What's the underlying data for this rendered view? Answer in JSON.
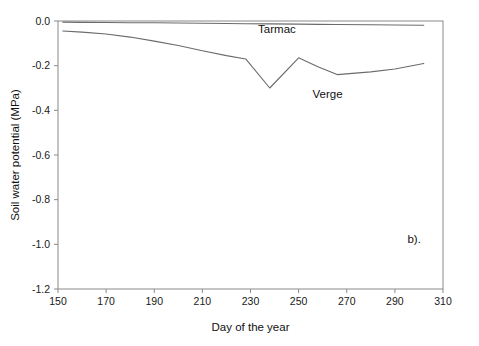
{
  "chart_data": {
    "type": "line",
    "title": "",
    "xlabel": "Day of the year",
    "ylabel": "Soil water potential (MPa)",
    "xlim": [
      150,
      310
    ],
    "ylim": [
      -1.2,
      0.0
    ],
    "xticks": [
      150,
      170,
      190,
      210,
      230,
      250,
      270,
      290,
      310
    ],
    "yticks": [
      0.0,
      -0.2,
      -0.4,
      -0.6,
      -0.8,
      -1.0,
      -1.2
    ],
    "xtick_labels": [
      "150",
      "170",
      "190",
      "210",
      "230",
      "250",
      "270",
      "290",
      "310"
    ],
    "ytick_labels": [
      "0.0",
      "-0.2",
      "-0.4",
      "-0.6",
      "-0.8",
      "-1.0",
      "-1.2"
    ],
    "grid": false,
    "legend_position": "inline-annotation",
    "annotations": [
      {
        "text": "Tarmac",
        "x": 241,
        "y": -0.055
      },
      {
        "text": "Verge",
        "x": 262,
        "y": -0.345
      },
      {
        "text": "b).",
        "x": 298,
        "y": -0.995
      }
    ],
    "series": [
      {
        "name": "Tarmac",
        "color": "#6b6b6b",
        "x": [
          152,
          160,
          170,
          180,
          190,
          200,
          210,
          220,
          228,
          238,
          250,
          258,
          266,
          280,
          290,
          302
        ],
        "values": [
          -0.005,
          -0.006,
          -0.007,
          -0.008,
          -0.008,
          -0.009,
          -0.01,
          -0.011,
          -0.012,
          -0.013,
          -0.014,
          -0.015,
          -0.016,
          -0.017,
          -0.018,
          -0.019
        ]
      },
      {
        "name": "Verge",
        "color": "#6b6b6b",
        "x": [
          152,
          160,
          170,
          180,
          190,
          200,
          210,
          220,
          228,
          238,
          250,
          258,
          266,
          280,
          290,
          302
        ],
        "values": [
          -0.045,
          -0.05,
          -0.058,
          -0.072,
          -0.09,
          -0.11,
          -0.133,
          -0.155,
          -0.17,
          -0.3,
          -0.165,
          -0.205,
          -0.24,
          -0.228,
          -0.215,
          -0.19
        ]
      }
    ]
  }
}
